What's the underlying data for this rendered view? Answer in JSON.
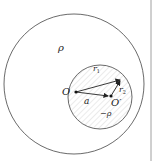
{
  "diagram": {
    "labels": {
      "outer_density": "ρ",
      "inner_density": "−ρ",
      "center_outer": "O",
      "center_inner": "O′",
      "offset": "a",
      "r1": "r",
      "r1_sub": "1",
      "r2": "r",
      "r2_sub": "2"
    },
    "colors": {
      "stroke": "#333333",
      "hatch": "#cccccc",
      "background": "#ffffff"
    }
  }
}
